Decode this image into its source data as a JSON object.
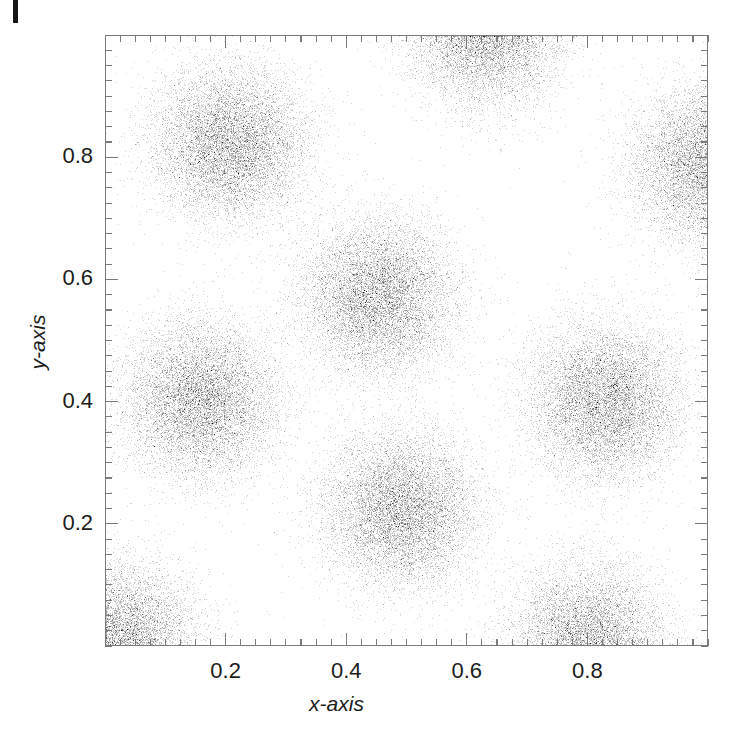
{
  "figure": {
    "kind": "scatter-density-plot",
    "background_color": "#ffffff",
    "frame_color": "#7b7b7b",
    "point_color": "#222222",
    "artifact": {
      "name": "scan-edge-artifact",
      "color": "#161616"
    }
  },
  "axes": {
    "x_title": "x-axis",
    "y_title": "y-axis",
    "x_ticklabels": [
      "0.2",
      "0.4",
      "0.6",
      "0.8"
    ],
    "y_ticklabels": [
      "0.2",
      "0.4",
      "0.6",
      "0.8"
    ],
    "x_tickvalues": [
      0.2,
      0.4,
      0.6,
      0.8
    ],
    "y_tickvalues": [
      0.2,
      0.4,
      0.6,
      0.8
    ],
    "minor_tick_step": 0.025,
    "xlim": [
      0.0,
      1.0
    ],
    "ylim": [
      0.0,
      1.0
    ],
    "grid": false
  },
  "chart_data": {
    "type": "scatter",
    "title": "",
    "xlabel": "x-axis",
    "ylabel": "y-axis",
    "xlim": [
      0.0,
      1.0
    ],
    "ylim": [
      0.0,
      1.0
    ],
    "grid": false,
    "legend": null,
    "xticks": [
      0.2,
      0.4,
      0.6,
      0.8
    ],
    "yticks": [
      0.2,
      0.4,
      0.6,
      0.8
    ],
    "marker": {
      "shape": "point",
      "size": 1,
      "color": "#222222",
      "alpha": 0.3
    },
    "clusters": [
      {
        "name": "upper-left",
        "cx": 0.207,
        "cy": 0.824,
        "sigma": 0.062,
        "n": 9000
      },
      {
        "name": "top-center",
        "cx": 0.632,
        "cy": 1.012,
        "sigma": 0.062,
        "n": 9000
      },
      {
        "name": "upper-right",
        "cx": 1.002,
        "cy": 0.788,
        "sigma": 0.062,
        "n": 9000
      },
      {
        "name": "center",
        "cx": 0.452,
        "cy": 0.574,
        "sigma": 0.062,
        "n": 9000
      },
      {
        "name": "mid-left",
        "cx": 0.158,
        "cy": 0.404,
        "sigma": 0.062,
        "n": 9000
      },
      {
        "name": "mid-right",
        "cx": 0.828,
        "cy": 0.402,
        "sigma": 0.062,
        "n": 9000
      },
      {
        "name": "lower-center",
        "cx": 0.489,
        "cy": 0.225,
        "sigma": 0.062,
        "n": 9000
      },
      {
        "name": "bottom-left",
        "cx": 0.022,
        "cy": 0.01,
        "sigma": 0.062,
        "n": 9000
      },
      {
        "name": "bottom-right",
        "cx": 0.8,
        "cy": 0.006,
        "sigma": 0.062,
        "n": 9000
      }
    ]
  }
}
